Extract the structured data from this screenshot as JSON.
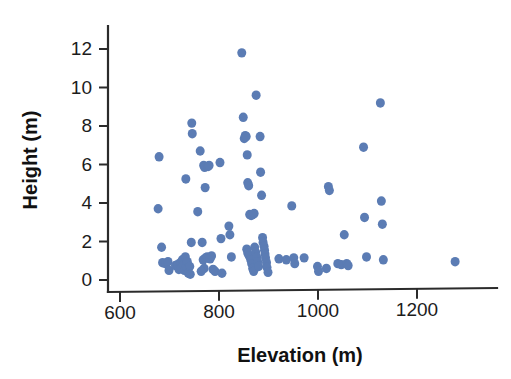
{
  "chart_data": {
    "type": "scatter",
    "title": "",
    "xlabel": "Elevation (m)",
    "ylabel": "Height (m)",
    "xlim": [
      540,
      1320
    ],
    "ylim": [
      -0.45,
      12.6
    ],
    "xticks": [
      600,
      800,
      1000,
      1200
    ],
    "xticklabels": [
      "600",
      "800",
      "1000",
      "1200"
    ],
    "yticks": [
      0,
      2,
      4,
      6,
      8,
      10,
      12
    ],
    "yticklabels": [
      "0",
      "2",
      "4",
      "6",
      "8",
      "10",
      "12"
    ],
    "grid": false,
    "legend": null,
    "marker_color": "#5b7cb4",
    "marker_size": 9,
    "series": [
      {
        "name": "trees",
        "points": [
          [
            679,
            6.4
          ],
          [
            677,
            3.7
          ],
          [
            684,
            1.7
          ],
          [
            686,
            0.9
          ],
          [
            692,
            0.85
          ],
          [
            697,
            0.95
          ],
          [
            699,
            0.5
          ],
          [
            712,
            0.75
          ],
          [
            716,
            0.8
          ],
          [
            719,
            0.55
          ],
          [
            722,
            0.9
          ],
          [
            724,
            0.62
          ],
          [
            726,
            1.05
          ],
          [
            728,
            0.78
          ],
          [
            730,
            0.5
          ],
          [
            732,
            1.2
          ],
          [
            734,
            0.72
          ],
          [
            736,
            0.95
          ],
          [
            738,
            0.35
          ],
          [
            733,
            5.25
          ],
          [
            745,
            8.15
          ],
          [
            746,
            7.6
          ],
          [
            744,
            1.95
          ],
          [
            741,
            0.7
          ],
          [
            742,
            0.3
          ],
          [
            757,
            3.55
          ],
          [
            762,
            6.7
          ],
          [
            769,
            5.95
          ],
          [
            771,
            5.85
          ],
          [
            778,
            5.9
          ],
          [
            780,
            5.95
          ],
          [
            772,
            4.8
          ],
          [
            766,
            1.95
          ],
          [
            768,
            1.05
          ],
          [
            770,
            0.6
          ],
          [
            773,
            1.15
          ],
          [
            776,
            1.2
          ],
          [
            779,
            1.15
          ],
          [
            782,
            1.1
          ],
          [
            785,
            1.25
          ],
          [
            764,
            0.45
          ],
          [
            788,
            0.55
          ],
          [
            792,
            0.45
          ],
          [
            802,
            6.1
          ],
          [
            804,
            2.15
          ],
          [
            806,
            0.35
          ],
          [
            820,
            2.8
          ],
          [
            822,
            2.35
          ],
          [
            825,
            1.2
          ],
          [
            846,
            11.8
          ],
          [
            849,
            8.45
          ],
          [
            851,
            7.35
          ],
          [
            853,
            7.5
          ],
          [
            855,
            7.45
          ],
          [
            857,
            6.5
          ],
          [
            858,
            5.05
          ],
          [
            860,
            4.9
          ],
          [
            862,
            3.4
          ],
          [
            865,
            3.35
          ],
          [
            868,
            3.4
          ],
          [
            871,
            3.45
          ],
          [
            856,
            1.6
          ],
          [
            858,
            1.4
          ],
          [
            861,
            1.25
          ],
          [
            864,
            1.05
          ],
          [
            866,
            0.85
          ],
          [
            868,
            0.6
          ],
          [
            870,
            0.45
          ],
          [
            872,
            1.7
          ],
          [
            874,
            1.45
          ],
          [
            876,
            1.2
          ],
          [
            878,
            0.95
          ],
          [
            880,
            0.7
          ],
          [
            875,
            9.6
          ],
          [
            883,
            7.45
          ],
          [
            884,
            5.6
          ],
          [
            886,
            4.4
          ],
          [
            888,
            2.2
          ],
          [
            889,
            1.95
          ],
          [
            891,
            1.75
          ],
          [
            892,
            1.55
          ],
          [
            893,
            1.35
          ],
          [
            894,
            1.15
          ],
          [
            896,
            0.9
          ],
          [
            897,
            0.65
          ],
          [
            899,
            0.4
          ],
          [
            921,
            1.1
          ],
          [
            936,
            1.05
          ],
          [
            947,
            3.85
          ],
          [
            951,
            1.15
          ],
          [
            953,
            0.85
          ],
          [
            972,
            1.15
          ],
          [
            999,
            0.7
          ],
          [
            1001,
            0.45
          ],
          [
            1017,
            0.6
          ],
          [
            1021,
            4.85
          ],
          [
            1023,
            4.65
          ],
          [
            1040,
            0.85
          ],
          [
            1047,
            0.8
          ],
          [
            1053,
            2.35
          ],
          [
            1058,
            0.85
          ],
          [
            1061,
            0.75
          ],
          [
            1092,
            6.9
          ],
          [
            1094,
            3.25
          ],
          [
            1098,
            1.2
          ],
          [
            1126,
            9.2
          ],
          [
            1128,
            4.1
          ],
          [
            1130,
            2.9
          ],
          [
            1132,
            1.05
          ],
          [
            1277,
            0.95
          ]
        ]
      }
    ]
  },
  "axes": {
    "x_title": "Elevation (m)",
    "y_title": "Height (m)"
  }
}
